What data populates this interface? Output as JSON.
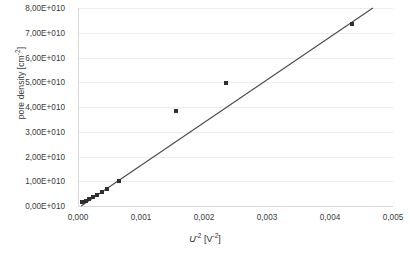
{
  "chart_data": {
    "type": "scatter",
    "title": "",
    "xlabel": "U⁻² [V⁻²]",
    "xlabel_base": "U",
    "xlabel_exp": "-2",
    "xlabel_unit_base": "V",
    "xlabel_unit_exp": "-2",
    "ylabel": "pore density [cm⁻²]",
    "ylabel_base": "pore density [cm",
    "ylabel_exp": "-2",
    "ylabel_tail": "]",
    "xlim": [
      0,
      0.005
    ],
    "ylim": [
      0,
      80000000000
    ],
    "grid": true,
    "grid_axis": "y",
    "legend": "none",
    "marker_color": "#2f2f2f",
    "marker_shape": "square",
    "trendline_color": "#4a4a4a",
    "gridline_color": "#ececec",
    "xticks": [
      0,
      0.001,
      0.002,
      0.003,
      0.004,
      0.005
    ],
    "xticklabels": [
      "0,000",
      "0,001",
      "0,002",
      "0,003",
      "0,004",
      "0,005"
    ],
    "yticks": [
      0,
      10000000000,
      20000000000,
      30000000000,
      40000000000,
      50000000000,
      60000000000,
      70000000000,
      80000000000
    ],
    "yticklabels": [
      "0,00E+010",
      "1,00E+010",
      "2,00E+010",
      "3,00E+010",
      "4,00E+010",
      "5,00E+010",
      "6,00E+010",
      "7,00E+010",
      "8,00E+010"
    ],
    "x": [
      6e-05,
      0.00012,
      0.00018,
      0.00024,
      0.0003,
      0.00038,
      0.00046,
      0.00065,
      0.00155,
      0.00235,
      0.00435
    ],
    "y": [
      1500000000,
      2200000000,
      3000000000,
      3800000000,
      4600000000,
      5800000000,
      7000000000,
      9900000000,
      38500000000,
      49500000000,
      73500000000
    ],
    "series": [
      {
        "name": "pore density",
        "points": [
          {
            "x": 6e-05,
            "y": 1500000000
          },
          {
            "x": 0.00012,
            "y": 2200000000
          },
          {
            "x": 0.00018,
            "y": 3000000000
          },
          {
            "x": 0.00024,
            "y": 3800000000
          },
          {
            "x": 0.0003,
            "y": 4600000000
          },
          {
            "x": 0.00038,
            "y": 5800000000
          },
          {
            "x": 0.00046,
            "y": 7000000000
          },
          {
            "x": 0.00065,
            "y": 9900000000
          },
          {
            "x": 0.00155,
            "y": 38500000000
          },
          {
            "x": 0.00235,
            "y": 49500000000
          },
          {
            "x": 0.00435,
            "y": 73500000000
          }
        ]
      }
    ],
    "trendline": {
      "type": "linear",
      "x0": 5e-05,
      "y0": 0,
      "x1": 0.00468,
      "y1": 80000000000
    }
  }
}
